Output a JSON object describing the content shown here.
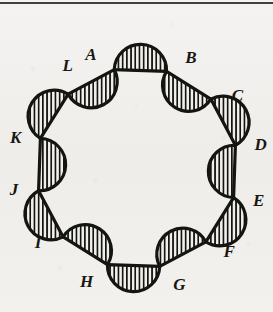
{
  "figure": {
    "background_color": "#f1f0ed",
    "ink_color": "#141410",
    "hatch_color": "#141410",
    "outline_width": 3.2,
    "hatch_spacing": 4.2,
    "hatch_width": 1.7,
    "center": {
      "x": 137,
      "y": 168
    },
    "radius": 101,
    "vertex_count": 12,
    "lobe_count": 12,
    "top_rule": {
      "present": true,
      "color": "#2e2e2c",
      "y": 2,
      "height": 2
    },
    "vertices": [
      {
        "id": "A",
        "label": "A",
        "angle_deg": -103,
        "label_offset": 22,
        "label_angle_deg": -112
      },
      {
        "id": "B",
        "label": "B",
        "angle_deg": -73,
        "label_offset": 22,
        "label_angle_deg": -64
      },
      {
        "id": "C",
        "label": "C",
        "angle_deg": -43,
        "label_offset": 23,
        "label_angle_deg": -36
      },
      {
        "id": "D",
        "label": "D",
        "angle_deg": -13,
        "label_offset": 25,
        "label_angle_deg": -11
      },
      {
        "id": "E",
        "label": "E",
        "angle_deg": 17,
        "label_offset": 25,
        "label_angle_deg": 15
      },
      {
        "id": "F",
        "label": "F",
        "angle_deg": 47,
        "label_offset": 23,
        "label_angle_deg": 42
      },
      {
        "id": "G",
        "label": "G",
        "angle_deg": 77,
        "label_offset": 23,
        "label_angle_deg": 70
      },
      {
        "id": "H",
        "label": "H",
        "angle_deg": 107,
        "label_offset": 23,
        "label_angle_deg": 114
      },
      {
        "id": "I",
        "label": "I",
        "angle_deg": 137,
        "label_offset": 23,
        "label_angle_deg": 143
      },
      {
        "id": "J",
        "label": "J",
        "angle_deg": 167,
        "label_offset": 24,
        "label_angle_deg": 170
      },
      {
        "id": "K",
        "label": "K",
        "angle_deg": 197,
        "label_offset": 24,
        "label_angle_deg": 194
      },
      {
        "id": "L",
        "label": "L",
        "angle_deg": 227,
        "label_offset": 23,
        "label_angle_deg": 236
      }
    ],
    "lobes": [
      {
        "from": "A",
        "to": "B",
        "bulge": "outward",
        "hatched": true
      },
      {
        "from": "B",
        "to": "C",
        "bulge": "inward",
        "hatched": true
      },
      {
        "from": "C",
        "to": "D",
        "bulge": "outward",
        "hatched": true
      },
      {
        "from": "D",
        "to": "E",
        "bulge": "inward",
        "hatched": true
      },
      {
        "from": "E",
        "to": "F",
        "bulge": "outward",
        "hatched": true
      },
      {
        "from": "F",
        "to": "G",
        "bulge": "inward",
        "hatched": true
      },
      {
        "from": "G",
        "to": "H",
        "bulge": "outward",
        "hatched": true
      },
      {
        "from": "H",
        "to": "I",
        "bulge": "inward",
        "hatched": true
      },
      {
        "from": "I",
        "to": "J",
        "bulge": "outward",
        "hatched": true
      },
      {
        "from": "J",
        "to": "K",
        "bulge": "inward",
        "hatched": true
      },
      {
        "from": "K",
        "to": "L",
        "bulge": "outward",
        "hatched": true
      },
      {
        "from": "L",
        "to": "A",
        "bulge": "inward",
        "hatched": true
      }
    ]
  }
}
